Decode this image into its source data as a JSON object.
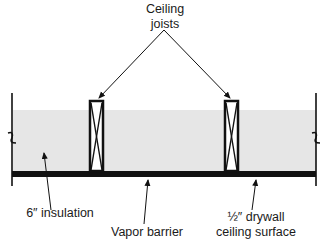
{
  "diagram": {
    "labels": {
      "ceiling_joists_line1": "Ceiling",
      "ceiling_joists_line2": "joists",
      "insulation": "6″ insulation",
      "vapor_barrier": "Vapor barrier",
      "drywall_line1": "½″ drywall",
      "drywall_line2": "ceiling surface"
    },
    "colors": {
      "insulation_fill": "#e6e6e6",
      "line": "#111111",
      "background": "#ffffff"
    }
  }
}
